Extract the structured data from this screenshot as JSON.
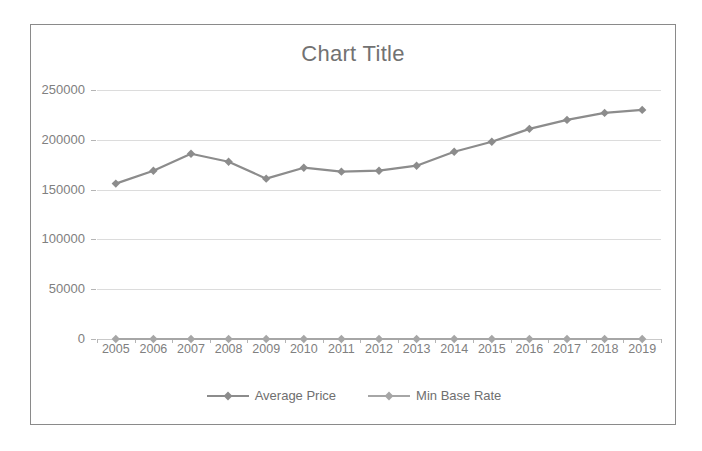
{
  "page": {
    "cutoff_text": "Ilinnsi ivan linesi"
  },
  "chart_frame": {
    "border_color": "#8a8a8a",
    "background": "#ffffff"
  },
  "legend": {
    "position": "bottom",
    "items": [
      {
        "label": "Average Price",
        "color": "#8c8c8c"
      },
      {
        "label": "Min Base Rate",
        "color": "#a6a6a6"
      }
    ]
  },
  "chart_data": {
    "type": "line",
    "title": "Chart Title",
    "xlabel": "",
    "ylabel": "",
    "grid": true,
    "legend_position": "bottom",
    "ylim": [
      0,
      250000
    ],
    "yticks": [
      0,
      50000,
      100000,
      150000,
      200000,
      250000
    ],
    "ytick_labels": [
      "0",
      "50000",
      "100000",
      "150000",
      "200000",
      "250000"
    ],
    "categories": [
      "2005",
      "2006",
      "2007",
      "2008",
      "2009",
      "2010",
      "2011",
      "2012",
      "2013",
      "2014",
      "2015",
      "2016",
      "2017",
      "2018",
      "2019"
    ],
    "series": [
      {
        "name": "Average Price",
        "color": "#8c8c8c",
        "marker": "diamond",
        "values": [
          156000,
          169000,
          186000,
          178000,
          161000,
          172000,
          168000,
          169000,
          174000,
          188000,
          198000,
          211000,
          220000,
          227000,
          230000
        ]
      },
      {
        "name": "Min Base Rate",
        "color": "#a6a6a6",
        "marker": "diamond",
        "values": [
          0,
          0,
          0,
          0,
          0,
          0,
          0,
          0,
          0,
          0,
          0,
          0,
          0,
          0,
          0
        ]
      }
    ]
  }
}
